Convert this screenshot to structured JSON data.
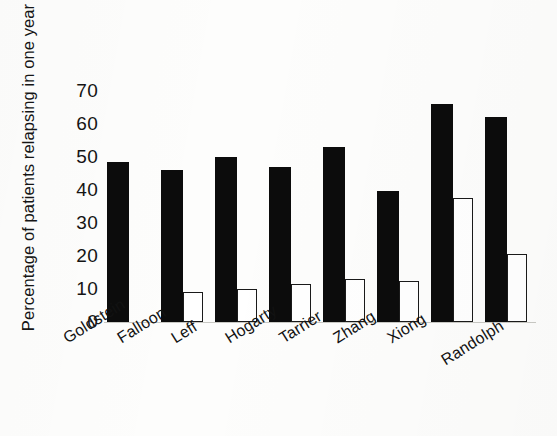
{
  "chart_data": {
    "type": "bar",
    "title": "",
    "xlabel": "",
    "ylabel": "Percentage of patients relapsing in one year",
    "ylim": [
      0,
      72
    ],
    "yticks": [
      0,
      10,
      20,
      30,
      40,
      50,
      60,
      70
    ],
    "ytick_labels": [
      "0",
      "10",
      "20",
      "30",
      "40",
      "50",
      "60",
      "70"
    ],
    "grid": false,
    "legend": "none",
    "categories": [
      "Goldstein",
      "Falloon",
      "Leff",
      "Hogarty",
      "Tarrier",
      "Zhang",
      "Xiong",
      "Randolph"
    ],
    "series": [
      {
        "name": "control",
        "style": "filled-black",
        "color": "#0c0c0c",
        "values": [
          48.5,
          46,
          50,
          47,
          53,
          39.5,
          66,
          62
        ]
      },
      {
        "name": "intervention",
        "style": "open-outline",
        "color": "#ffffff",
        "values": [
          null,
          9,
          10,
          11.5,
          13,
          12.5,
          37.5,
          20.5
        ]
      }
    ]
  },
  "axis": {
    "y_title": "Percentage of patients relapsing in one year"
  }
}
